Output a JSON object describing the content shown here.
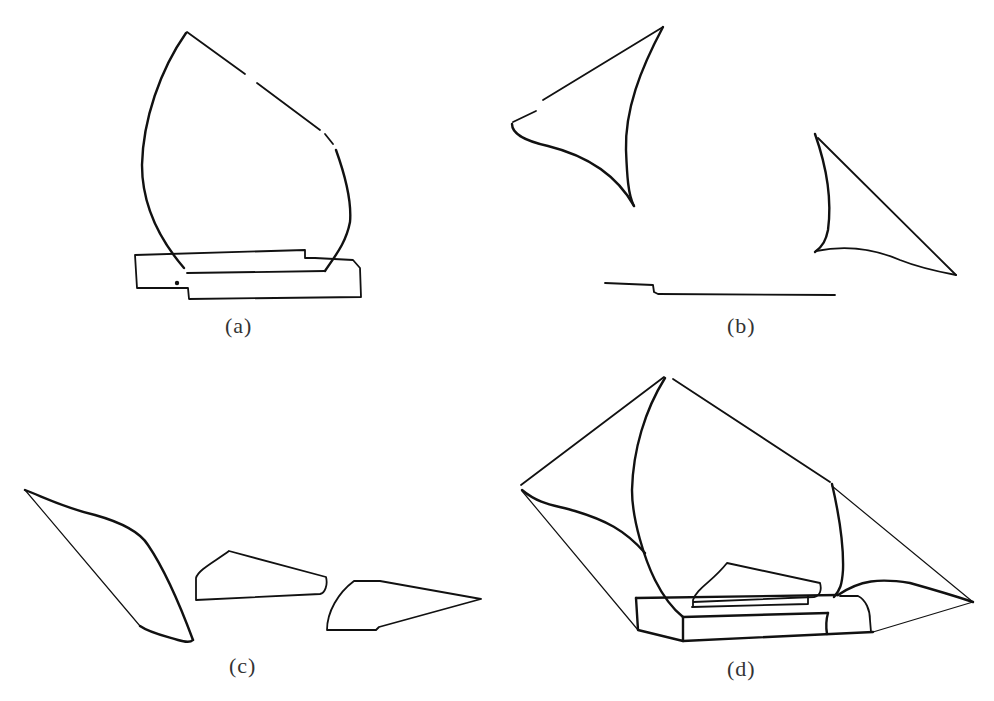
{
  "figure": {
    "panels": [
      {
        "id": "a",
        "label": "(a)",
        "description": "Tall curved sail shape standing on a stepped rectangular base"
      },
      {
        "id": "b",
        "label": "(b)",
        "description": "Two separated triangular curved sail pieces and a stepped base line"
      },
      {
        "id": "c",
        "label": "(c)",
        "description": "Three separate pieces: a long leaf-shaped piece and two small wedge shapes"
      },
      {
        "id": "d",
        "label": "(d)",
        "description": "Combined assembly: large sail with side panels over a 3D box base with a small wedge on top"
      }
    ],
    "stroke_color": "#111111",
    "background_color": "#ffffff"
  }
}
